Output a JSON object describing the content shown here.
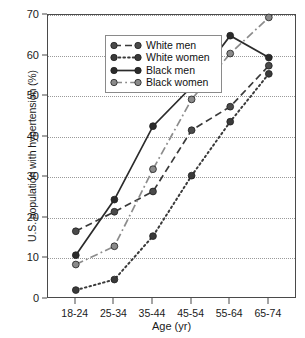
{
  "chart_data": {
    "type": "line",
    "title": "",
    "xlabel": "Age (yr)",
    "ylabel": "U.S. population with hypertension (%)",
    "categories": [
      "18-24",
      "25-34",
      "35-44",
      "45-54",
      "55-64",
      "65-74"
    ],
    "ylim": [
      0,
      70
    ],
    "yticks": [
      0,
      10,
      20,
      30,
      40,
      50,
      60,
      70
    ],
    "grid": "horizontal-dotted",
    "legend_position": "top-left-inside",
    "series": [
      {
        "name": "White men",
        "line_style": "dashed",
        "color": "#3a3a3a",
        "marker": "circle",
        "marker_color": "#4a4a4a",
        "values": [
          16.7,
          21.5,
          26.5,
          41.6,
          47.4,
          57.5
        ]
      },
      {
        "name": "White women",
        "line_style": "dotted",
        "color": "#3a3a3a",
        "marker": "circle",
        "marker_color": "#3a3a3a",
        "values": [
          2.2,
          4.8,
          15.5,
          30.4,
          43.7,
          55.5
        ]
      },
      {
        "name": "Black men",
        "line_style": "solid",
        "color": "#2b2b2b",
        "marker": "circle",
        "marker_color": "#2b2b2b",
        "values": [
          10.8,
          24.5,
          42.6,
          52.3,
          64.9,
          59.5
        ]
      },
      {
        "name": "Black women",
        "line_style": "dashdot",
        "color": "#8c8c8c",
        "marker": "circle",
        "marker_color": "#8a8a8a",
        "values": [
          8.5,
          13.0,
          32.0,
          49.2,
          60.5,
          69.4
        ]
      }
    ]
  },
  "legend": {
    "items": [
      {
        "label": "White men"
      },
      {
        "label": "White women"
      },
      {
        "label": "Black men"
      },
      {
        "label": "Black women"
      }
    ]
  },
  "colors": {
    "axis": "#4a4a4a",
    "grid": "#9a9a9a",
    "background": "#ffffff",
    "text": "#1a1a1a"
  }
}
